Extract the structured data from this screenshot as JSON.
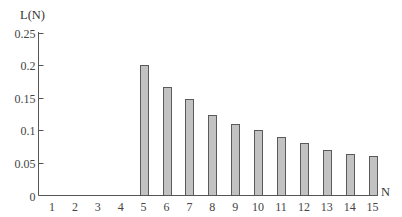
{
  "chart_data": {
    "type": "bar",
    "title": "",
    "xlabel": "N",
    "ylabel": "L(N)",
    "categories": [
      "1",
      "2",
      "3",
      "4",
      "5",
      "6",
      "7",
      "8",
      "9",
      "10",
      "11",
      "12",
      "13",
      "14",
      "15"
    ],
    "values": [
      0,
      0,
      0,
      0,
      0.2,
      0.167,
      0.148,
      0.124,
      0.11,
      0.1,
      0.09,
      0.08,
      0.07,
      0.063,
      0.06
    ],
    "ylim": [
      0,
      0.25
    ],
    "yticks": [
      "0",
      "0.05",
      "0.1",
      "0.15",
      "0.2",
      "0.25"
    ],
    "ytick_values": [
      0,
      0.05,
      0.1,
      0.15,
      0.2,
      0.25
    ],
    "grid": false,
    "legend": null,
    "colors": {
      "bar_fill": "#c2c2c2",
      "bar_stroke": "#5a5a5a",
      "axis": "#555555"
    }
  }
}
